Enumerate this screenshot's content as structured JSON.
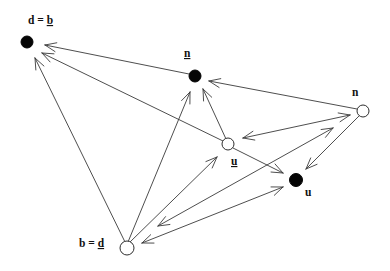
{
  "diagram": {
    "width": 390,
    "height": 271,
    "colors": {
      "line": "#3a3a3a",
      "node": "#050505",
      "background": "#ffffff"
    },
    "nodes": [
      {
        "id": "d_b",
        "style": "filled",
        "x": 27,
        "y": 42,
        "r": 6,
        "label": [
          {
            "text": "d = "
          },
          {
            "text": "b",
            "underline": true
          }
        ],
        "label_x": 28,
        "label_y": 24
      },
      {
        "id": "n_filled",
        "style": "filled",
        "x": 195,
        "y": 76,
        "r": 6,
        "label": [
          {
            "text": "n",
            "underline": true
          }
        ],
        "label_x": 184,
        "label_y": 57
      },
      {
        "id": "n_open",
        "style": "open",
        "x": 363,
        "y": 111,
        "r": 6,
        "label": [
          {
            "text": "n"
          }
        ],
        "label_x": 352,
        "label_y": 96
      },
      {
        "id": "u_open",
        "style": "open",
        "x": 228,
        "y": 144,
        "r": 6,
        "label": [
          {
            "text": "u",
            "underline": true
          }
        ],
        "label_x": 231,
        "label_y": 165
      },
      {
        "id": "u_filled",
        "style": "filled",
        "x": 296,
        "y": 180,
        "r": 6.5,
        "label": [
          {
            "text": "u"
          }
        ],
        "label_x": 305,
        "label_y": 196
      },
      {
        "id": "b_d",
        "style": "open",
        "x": 127,
        "y": 248,
        "r": 7,
        "label": [
          {
            "text": "b = "
          },
          {
            "text": "d",
            "underline": true
          }
        ],
        "label_x": 79,
        "label_y": 247
      }
    ],
    "edges": [
      {
        "from": "n_filled",
        "to": "d_b",
        "x1": 189,
        "y1": 74,
        "x2": 45,
        "y2": 45,
        "arrow_start": false,
        "arrow_end": true
      },
      {
        "from": "u_open",
        "to": "d_b",
        "x1": 223,
        "y1": 141,
        "x2": 42,
        "y2": 53,
        "arrow_start": false,
        "arrow_end": true
      },
      {
        "from": "b_d",
        "to": "d_b",
        "x1": 125,
        "y1": 242,
        "x2": 35,
        "y2": 58,
        "arrow_start": false,
        "arrow_end": true
      },
      {
        "from": "b_d",
        "to": "n_filled",
        "x1": 128,
        "y1": 242,
        "x2": 190,
        "y2": 92,
        "arrow_start": false,
        "arrow_end": true
      },
      {
        "from": "u_open",
        "to": "n_filled",
        "x1": 226,
        "y1": 139,
        "x2": 203,
        "y2": 89,
        "arrow_start": false,
        "arrow_end": true
      },
      {
        "from": "n_open",
        "to": "n_filled",
        "x1": 357,
        "y1": 109,
        "x2": 209,
        "y2": 81,
        "arrow_start": false,
        "arrow_end": true
      },
      {
        "from": "u_open",
        "to": "u_filled",
        "x1": 233,
        "y1": 148,
        "x2": 283,
        "y2": 173,
        "arrow_start": false,
        "arrow_end": true
      },
      {
        "from": "b_d",
        "to": "u_open",
        "x1": 129,
        "y1": 243,
        "x2": 217,
        "y2": 157,
        "arrow_start": false,
        "arrow_end": true
      },
      {
        "from": "u_open",
        "to": "n_open",
        "x1": 243,
        "y1": 138,
        "x2": 350,
        "y2": 115,
        "arrow_start": true,
        "arrow_end": true
      },
      {
        "from": "b_d",
        "to": "n_open",
        "x1": 158,
        "y1": 226,
        "x2": 333,
        "y2": 128,
        "arrow_start": true,
        "arrow_end": true
      },
      {
        "from": "b_d",
        "to": "u_filled",
        "x1": 142,
        "y1": 243,
        "x2": 283,
        "y2": 187,
        "arrow_start": true,
        "arrow_end": true
      },
      {
        "from": "n_open",
        "to": "u_filled",
        "x1": 360,
        "y1": 115,
        "x2": 306,
        "y2": 169,
        "arrow_start": false,
        "arrow_end": true
      }
    ],
    "arrowhead": {
      "length": 12,
      "half_angle_deg": 22
    }
  }
}
